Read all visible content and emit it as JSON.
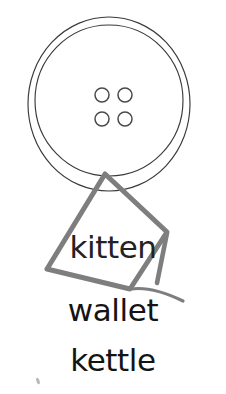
{
  "canvas": {
    "width": 226,
    "height": 394,
    "background_color": "#ffffff"
  },
  "illustration": {
    "name": "button",
    "description": "line drawing of a four-hole sewing button",
    "stroke_color": "#3a3a3a",
    "stroke_width": 1.1,
    "outer_ring": {
      "cx": 109,
      "cy": 104,
      "rx": 81,
      "ry": 87
    },
    "inner_ring": {
      "cx": 109,
      "cy": 100.5,
      "rx": 74,
      "ry": 75.5
    },
    "holes": [
      {
        "label": "hole-top-left",
        "cx": 102,
        "cy": 95,
        "r": 7
      },
      {
        "label": "hole-top-right",
        "cx": 125,
        "cy": 95,
        "r": 7
      },
      {
        "label": "hole-bottom-left",
        "cx": 102,
        "cy": 119,
        "r": 7
      },
      {
        "label": "hole-bottom-right",
        "cx": 125,
        "cy": 119,
        "r": 7
      }
    ]
  },
  "annotation": {
    "name": "hand-drawn-kite-shape",
    "description": "gray freehand quadrilateral with a tail drawn over the button",
    "stroke_color": "#808080",
    "stroke_width": 5,
    "outline_points": "105,174 47,269 130,289 167,232 105,174",
    "inner_edge_points": "167,232 157,283",
    "tail_points": "130,289 157,283 183,301"
  },
  "labels": {
    "items": [
      {
        "id": "kitten",
        "text": "kitten"
      },
      {
        "id": "wallet",
        "text": "wallet"
      },
      {
        "id": "kettle",
        "text": "kettle"
      }
    ]
  },
  "speck": {
    "name": "stray-pencil-mark",
    "x": 38,
    "y": 381,
    "color": "#b9b9b9"
  }
}
